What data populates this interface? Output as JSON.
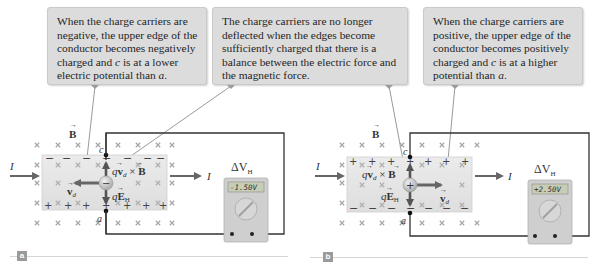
{
  "callouts": [
    {
      "id": "negative-carriers",
      "lines": [
        "When the charge carriers are",
        "negative, the upper edge of the",
        "conductor becomes negatively",
        "charged and ",
        "c",
        " is at a lower",
        "electric potential than ",
        "a",
        "."
      ],
      "text": "When the charge carriers are negative, the upper edge of the conductor becomes negatively charged and c is at a lower electric potential than a."
    },
    {
      "id": "balance",
      "text": "The charge carriers are no longer deflected when the edges become sufficiently charged that there is a balance between the electric force and the magnetic force."
    },
    {
      "id": "positive-carriers",
      "text": "When the charge carriers are positive, the upper edge of the conductor becomes positively charged and c is at a higher potential than a."
    }
  ],
  "callout_text": {
    "neg_1": "When the charge carriers are",
    "neg_2": "negative, the upper edge of the",
    "neg_3": "conductor becomes negatively",
    "neg_4a": "charged and ",
    "neg_4b": "c",
    "neg_4c": " is at a lower",
    "neg_5a": "electric potential than ",
    "neg_5b": "a",
    "neg_5c": ".",
    "bal_1": "The charge carriers are no longer",
    "bal_2": "deflected when the edges become",
    "bal_3": "sufficiently charged that there is a",
    "bal_4": "balance between the electric force and",
    "bal_5": "the magnetic force.",
    "pos_1": "When the charge carriers are",
    "pos_2": "positive, the upper edge of the",
    "pos_3": "conductor becomes positively",
    "pos_4a": "charged and ",
    "pos_4b": "c",
    "pos_4c": " is at a higher",
    "pos_5a": "potential than ",
    "pos_5b": "a",
    "pos_5c": "."
  },
  "panels": [
    {
      "label": "a",
      "carrier_sign": "−",
      "top_edge_sign": "−",
      "bottom_edge_sign": "+",
      "field_label": "B",
      "current_label": "I",
      "drift_velocity_label": "v",
      "drift_subscript": "d",
      "drift_direction": "left",
      "magnetic_force_label": "qv",
      "magnetic_force_cross": "× B",
      "electric_force_label": "qE",
      "electric_force_subscript": "H",
      "point_top": "c",
      "point_bottom": "a",
      "meter_label": "ΔV",
      "meter_subscript": "H",
      "meter_reading": "-1.50V"
    },
    {
      "label": "b",
      "carrier_sign": "+",
      "top_edge_sign": "+",
      "bottom_edge_sign": "−",
      "field_label": "B",
      "current_label": "I",
      "drift_velocity_label": "v",
      "drift_subscript": "d",
      "drift_direction": "right",
      "magnetic_force_label": "qv",
      "magnetic_force_cross": "× B",
      "electric_force_label": "qE",
      "electric_force_subscript": "H",
      "point_top": "c",
      "point_bottom": "a",
      "meter_label": "ΔV",
      "meter_subscript": "H",
      "meter_reading": "+2.50V"
    }
  ],
  "colors": {
    "callout_bg": "#dcdcdc",
    "conductor_fill": "#e4e4e4",
    "field_x": "#a8a8a8",
    "arrow": "#666666",
    "wire": "#333333",
    "meter_body": "#cfcfcf",
    "meter_display": "#c8cdb6",
    "panel_label_bg": "#9a9a9a"
  }
}
